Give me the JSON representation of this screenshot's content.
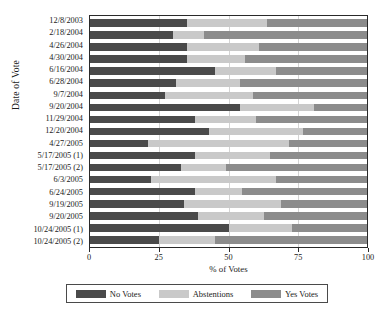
{
  "chart_data": {
    "type": "bar",
    "orientation": "horizontal",
    "stacked": true,
    "stack_mode": "percent",
    "title": "",
    "xlabel": "% of Votes",
    "ylabel": "Date of Vote",
    "xlim": [
      0,
      100
    ],
    "xticks": [
      0,
      25,
      50,
      75,
      100
    ],
    "xtick_labels": [
      "0",
      "25",
      "50",
      "75",
      "100"
    ],
    "grid": true,
    "grid_axis": "x",
    "legend_position": "bottom",
    "categories": [
      "12/8/2003",
      "2/18/2004",
      "4/26/2004",
      "4/30/2004",
      "6/16/2004",
      "6/28/2004",
      "9/7/2004",
      "9/20/2004",
      "11/29/2004",
      "12/20/2004",
      "4/27/2005",
      "5/17/2005 (1)",
      "5/17/2005 (2)",
      "6/3/2005",
      "6/24/2005",
      "9/19/2005",
      "9/20/2005",
      "10/24/2005 (1)",
      "10/24/2005 (2)"
    ],
    "series": [
      {
        "name": "No Votes",
        "color": "#4a4a4a",
        "values": [
          35,
          30,
          35,
          35,
          45,
          31,
          27,
          54,
          38,
          43,
          21,
          38,
          33,
          22,
          38,
          34,
          39,
          50,
          25
        ]
      },
      {
        "name": "Abstentions",
        "color": "#c9c9c9",
        "values": [
          29,
          11,
          26,
          21,
          22,
          23,
          32,
          27,
          22,
          34,
          51,
          27,
          16,
          45,
          17,
          35,
          24,
          23,
          20
        ]
      },
      {
        "name": "Yes Votes",
        "color": "#8c8c8c",
        "values": [
          36,
          59,
          39,
          44,
          33,
          46,
          41,
          19,
          40,
          23,
          28,
          35,
          51,
          33,
          45,
          31,
          37,
          27,
          55
        ]
      }
    ]
  },
  "legend": {
    "items": [
      {
        "label": "No Votes",
        "color": "#4a4a4a",
        "swatch_name": "legend-swatch-no-votes"
      },
      {
        "label": "Abstentions",
        "color": "#c9c9c9",
        "swatch_name": "legend-swatch-abstentions"
      },
      {
        "label": "Yes Votes",
        "color": "#8c8c8c",
        "swatch_name": "legend-swatch-yes-votes"
      }
    ]
  }
}
